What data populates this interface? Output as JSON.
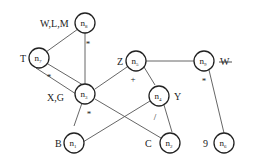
{
  "diagram": {
    "type": "dag",
    "nodes": [
      {
        "id": "n1",
        "base": "n",
        "sub": "1",
        "label": "B",
        "cx": 99,
        "cy": 143
      },
      {
        "id": "n2",
        "base": "n",
        "sub": "2",
        "label": "C",
        "cx": 170,
        "cy": 143
      },
      {
        "id": "n3",
        "base": "n",
        "sub": "3",
        "label": "X,G",
        "cx": 109,
        "cy": 94
      },
      {
        "id": "n4",
        "base": "n",
        "sub": "4",
        "label": "Y",
        "cx": 159,
        "cy": 96
      },
      {
        "id": "n5",
        "base": "n",
        "sub": "5",
        "label": "Z",
        "cx": 136,
        "cy": 61
      },
      {
        "id": "n6",
        "base": "n",
        "sub": "6",
        "label": "9",
        "cx": 224,
        "cy": 143
      },
      {
        "id": "n7",
        "base": "n",
        "sub": "7",
        "label": "T",
        "cx": 39,
        "cy": 58
      },
      {
        "id": "n8",
        "base": "n",
        "sub": "8",
        "label": "W,L,M",
        "cx": 85,
        "cy": 23
      },
      {
        "id": "n9",
        "base": "n",
        "sub": "9",
        "label": "W",
        "label_struck": true,
        "cx": 204,
        "cy": 61
      }
    ],
    "edges": [
      {
        "from": "n8",
        "to": "n7"
      },
      {
        "from": "n8",
        "to": "n3"
      },
      {
        "from": "n7",
        "to": "n3",
        "variant": "upper"
      },
      {
        "from": "n7",
        "to": "n3",
        "variant": "lower"
      },
      {
        "from": "n3",
        "to": "n5"
      },
      {
        "from": "n3",
        "to": "n1"
      },
      {
        "from": "n3",
        "to": "n2"
      },
      {
        "from": "n5",
        "to": "n9"
      },
      {
        "from": "n5",
        "to": "n4"
      },
      {
        "from": "n4",
        "to": "n1"
      },
      {
        "from": "n4",
        "to": "n2"
      },
      {
        "from": "n9",
        "to": "n6"
      }
    ],
    "operators": [
      {
        "node": "n8",
        "symbol": "*",
        "x": 77,
        "y": 49
      },
      {
        "node": "n7",
        "symbol": "*",
        "x": 50,
        "y": 75
      },
      {
        "node": "n3",
        "symbol": "*",
        "x": 88,
        "y": 114
      },
      {
        "node": "n5",
        "symbol": "+",
        "x": 105,
        "y": 79
      },
      {
        "node": "n4",
        "symbol": "/",
        "x": 155,
        "y": 118
      },
      {
        "node": "n9",
        "symbol": "*",
        "x": 204,
        "y": 82
      }
    ]
  }
}
